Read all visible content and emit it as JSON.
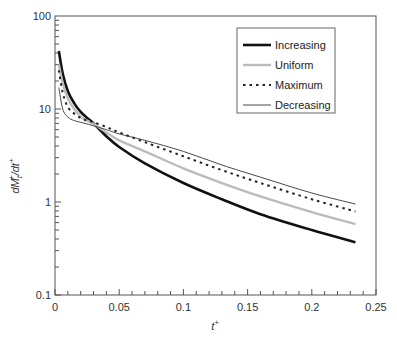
{
  "chart_data": {
    "type": "line",
    "title": "",
    "xlabel": "t⁺",
    "ylabel": "dMₜ⁺/dt⁺",
    "xlim": [
      0,
      0.25
    ],
    "ylim": [
      0.1,
      100
    ],
    "yscale": "log",
    "grid": false,
    "legend_position": "upper right (inside)",
    "x_ticks": [
      "0",
      "0.05",
      "0.1",
      "0.15",
      "0.2",
      "0.25"
    ],
    "y_ticks": [
      "0.1",
      "1",
      "10",
      "100"
    ],
    "x": [
      0.003,
      0.006,
      0.01,
      0.015,
      0.02,
      0.025,
      0.03,
      0.04,
      0.05,
      0.07,
      0.1,
      0.13,
      0.16,
      0.2,
      0.234
    ],
    "series": [
      {
        "name": "Increasing",
        "style": "solid-thick",
        "color": "#111111",
        "values": [
          42,
          24,
          15.5,
          11.5,
          9.3,
          8.0,
          7.0,
          5.1,
          3.9,
          2.6,
          1.6,
          1.07,
          0.74,
          0.5,
          0.37
        ]
      },
      {
        "name": "Uniform",
        "style": "solid-light",
        "color": "#bbbbbb",
        "values": [
          30,
          19,
          13,
          10,
          8.3,
          7.5,
          6.9,
          5.6,
          4.6,
          3.5,
          2.3,
          1.6,
          1.15,
          0.78,
          0.58
        ]
      },
      {
        "name": "Maximum",
        "style": "dotted",
        "color": "#222222",
        "values": [
          26,
          15,
          10.5,
          8.9,
          8.0,
          7.5,
          7.2,
          6.4,
          5.6,
          4.4,
          3.1,
          2.2,
          1.6,
          1.07,
          0.79
        ]
      },
      {
        "name": "Decreasing",
        "style": "solid-thin",
        "color": "#333333",
        "values": [
          17,
          10,
          8.2,
          7.5,
          7.2,
          6.9,
          6.6,
          6.0,
          5.4,
          4.6,
          3.5,
          2.5,
          1.85,
          1.25,
          0.95
        ]
      }
    ]
  },
  "legend": {
    "items": [
      {
        "label": "Increasing"
      },
      {
        "label": "Uniform"
      },
      {
        "label": "Maximum"
      },
      {
        "label": "Decreasing"
      }
    ]
  },
  "axes": {
    "x_title": "t",
    "x_title_sup": "+",
    "y_title_main": "dM",
    "y_title_sub": "t",
    "y_title_sup1": "+",
    "y_title_mid": "/dt",
    "y_title_sup2": "+"
  }
}
